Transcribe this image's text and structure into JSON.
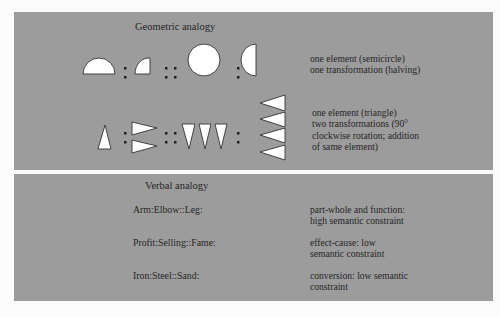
{
  "geometric": {
    "title": "Geometric analogy",
    "rows": [
      {
        "symbols": [
          "semicircle",
          ":",
          "quarter-circle",
          "::",
          "circle",
          ":",
          "half-circle-vertical"
        ],
        "description": "one element (semicircle)\none transformation (halving)"
      },
      {
        "symbols": [
          "triangle-up",
          ":",
          "two-triangles-right",
          "::",
          "three-triangles-down",
          ":",
          "four-triangles-left"
        ],
        "description": "one element (triangle)\ntwo transformations (90°\nclockwise rotation; addition\nof same element)"
      }
    ]
  },
  "verbal": {
    "title": "Verbal analogy",
    "rows": [
      {
        "analogy": "Arm:Elbow::Leg:",
        "description": "part-whole and function:\nhigh semantic constraint"
      },
      {
        "analogy": "Profit:Selling::Fame:",
        "description": "effect-cause: low\nsemantic constraint"
      },
      {
        "analogy": "Iron:Steel::Sand:",
        "description": "conversion: low semantic\nconstraint"
      }
    ]
  },
  "colors": {
    "panel": "#9c9c9c",
    "shape_fill": "#ffffff",
    "ink": "#262626",
    "background": "#fbfbfb"
  }
}
